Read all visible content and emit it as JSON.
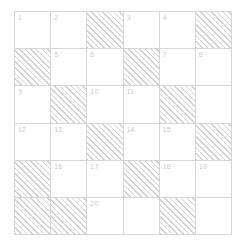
{
  "grid": {
    "rows": 6,
    "columns": 6,
    "colors": {
      "background": "#ffffff",
      "border": "#d6d6d6",
      "hatch": "#cfcfcf",
      "number_text": "#c9c9c9"
    },
    "cells": [
      {
        "row": 1,
        "col": 1,
        "number": "1",
        "hatched": false
      },
      {
        "row": 1,
        "col": 2,
        "number": "2",
        "hatched": false
      },
      {
        "row": 1,
        "col": 3,
        "number": "",
        "hatched": true
      },
      {
        "row": 1,
        "col": 4,
        "number": "3",
        "hatched": false
      },
      {
        "row": 1,
        "col": 5,
        "number": "4",
        "hatched": false
      },
      {
        "row": 1,
        "col": 6,
        "number": "",
        "hatched": true
      },
      {
        "row": 2,
        "col": 1,
        "number": "",
        "hatched": true
      },
      {
        "row": 2,
        "col": 2,
        "number": "5",
        "hatched": false
      },
      {
        "row": 2,
        "col": 3,
        "number": "6",
        "hatched": false
      },
      {
        "row": 2,
        "col": 4,
        "number": "",
        "hatched": true
      },
      {
        "row": 2,
        "col": 5,
        "number": "7",
        "hatched": false
      },
      {
        "row": 2,
        "col": 6,
        "number": "8",
        "hatched": false
      },
      {
        "row": 3,
        "col": 1,
        "number": "9",
        "hatched": false
      },
      {
        "row": 3,
        "col": 2,
        "number": "",
        "hatched": true
      },
      {
        "row": 3,
        "col": 3,
        "number": "10",
        "hatched": false
      },
      {
        "row": 3,
        "col": 4,
        "number": "11",
        "hatched": false
      },
      {
        "row": 3,
        "col": 5,
        "number": "",
        "hatched": true
      },
      {
        "row": 3,
        "col": 6,
        "number": "",
        "hatched": false
      },
      {
        "row": 4,
        "col": 1,
        "number": "12",
        "hatched": false
      },
      {
        "row": 4,
        "col": 2,
        "number": "13",
        "hatched": false
      },
      {
        "row": 4,
        "col": 3,
        "number": "",
        "hatched": true
      },
      {
        "row": 4,
        "col": 4,
        "number": "14",
        "hatched": false
      },
      {
        "row": 4,
        "col": 5,
        "number": "15",
        "hatched": false
      },
      {
        "row": 4,
        "col": 6,
        "number": "",
        "hatched": true
      },
      {
        "row": 5,
        "col": 1,
        "number": "",
        "hatched": true
      },
      {
        "row": 5,
        "col": 2,
        "number": "16",
        "hatched": false
      },
      {
        "row": 5,
        "col": 3,
        "number": "17",
        "hatched": false
      },
      {
        "row": 5,
        "col": 4,
        "number": "",
        "hatched": true
      },
      {
        "row": 5,
        "col": 5,
        "number": "18",
        "hatched": false
      },
      {
        "row": 5,
        "col": 6,
        "number": "19",
        "hatched": false
      },
      {
        "row": 6,
        "col": 1,
        "number": "",
        "hatched": true
      },
      {
        "row": 6,
        "col": 2,
        "number": "",
        "hatched": true
      },
      {
        "row": 6,
        "col": 3,
        "number": "20",
        "hatched": false
      },
      {
        "row": 6,
        "col": 4,
        "number": "",
        "hatched": false
      },
      {
        "row": 6,
        "col": 5,
        "number": "",
        "hatched": true
      },
      {
        "row": 6,
        "col": 6,
        "number": "",
        "hatched": false
      }
    ]
  }
}
